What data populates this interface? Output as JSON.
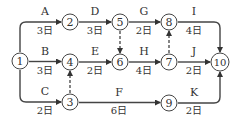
{
  "diagram": {
    "type": "activity-on-arrow network",
    "nodes": [
      {
        "id": "1",
        "label": "1",
        "x": 20,
        "y": 61
      },
      {
        "id": "2",
        "label": "2",
        "x": 70,
        "y": 22
      },
      {
        "id": "3",
        "label": "3",
        "x": 70,
        "y": 102
      },
      {
        "id": "4",
        "label": "4",
        "x": 70,
        "y": 62
      },
      {
        "id": "5",
        "label": "5",
        "x": 120,
        "y": 22
      },
      {
        "id": "6",
        "label": "6",
        "x": 120,
        "y": 62
      },
      {
        "id": "7",
        "label": "7",
        "x": 169,
        "y": 62
      },
      {
        "id": "8",
        "label": "8",
        "x": 169,
        "y": 22
      },
      {
        "id": "9",
        "label": "9",
        "x": 169,
        "y": 103
      },
      {
        "id": "10",
        "label": "10",
        "x": 220,
        "y": 62
      }
    ],
    "activities": [
      {
        "name": "A",
        "duration": "3日",
        "from": "1",
        "to": "2"
      },
      {
        "name": "B",
        "duration": "3日",
        "from": "1",
        "to": "4"
      },
      {
        "name": "C",
        "duration": "2日",
        "from": "1",
        "to": "3"
      },
      {
        "name": "D",
        "duration": "3日",
        "from": "2",
        "to": "5"
      },
      {
        "name": "E",
        "duration": "2日",
        "from": "4",
        "to": "6"
      },
      {
        "name": "F",
        "duration": "6日",
        "from": "3",
        "to": "9"
      },
      {
        "name": "G",
        "duration": "2日",
        "from": "5",
        "to": "8"
      },
      {
        "name": "H",
        "duration": "4日",
        "from": "6",
        "to": "7"
      },
      {
        "name": "I",
        "duration": "4日",
        "from": "8",
        "to": "10"
      },
      {
        "name": "J",
        "duration": "2日",
        "from": "7",
        "to": "10"
      },
      {
        "name": "K",
        "duration": "2日",
        "from": "9",
        "to": "10"
      }
    ],
    "dummy_activities": [
      {
        "from": "3",
        "to": "4"
      },
      {
        "from": "5",
        "to": "6"
      },
      {
        "from": "7",
        "to": "8"
      }
    ]
  }
}
